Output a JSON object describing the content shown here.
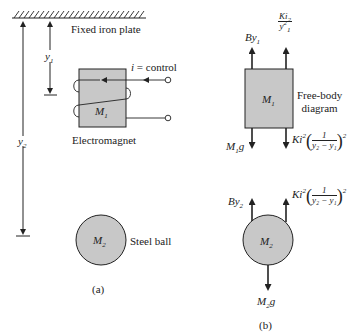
{
  "figure_a": {
    "plate_label": "Fixed iron plate",
    "y1_label": "y",
    "y1_sub": "1",
    "y2_label": "y",
    "y2_sub": "2",
    "control_label": "i = control",
    "electromagnet_mass": "M",
    "electromagnet_mass_sub": "1",
    "electromagnet_label": "Electromagnet",
    "ball_mass": "M",
    "ball_mass_sub": "2",
    "ball_label": "Steel ball",
    "caption": "(a)"
  },
  "figure_b": {
    "box_mass": "M",
    "box_mass_sub": "1",
    "fbd_label_line1": "Free-body",
    "fbd_label_line2": "diagram",
    "force_b_y1": "By",
    "force_b_y1_sub": "1",
    "force_magnetic_top_num": "Ki",
    "force_magnetic_top_num_sub": "2",
    "force_magnetic_top_den": "y",
    "force_magnetic_top_den_sup": "2",
    "force_magnetic_top_den_sub": "1",
    "force_weight_1": "M",
    "force_weight_1_sub": "1",
    "force_weight_1_g": "g",
    "force_ki2": "Ki",
    "force_ki2_sup": "2",
    "frac_num": "1",
    "frac_den": "y₂ − y₁",
    "frac_sup": "2",
    "force_b_y2": "By",
    "force_b_y2_sub": "2",
    "ball_mass": "M",
    "ball_mass_sub": "2",
    "force_weight_2": "M",
    "force_weight_2_sub": "2",
    "force_weight_2_g": "g",
    "caption": "(b)"
  },
  "colors": {
    "fill_gray": "#c8c8c8",
    "stroke": "#222222"
  }
}
